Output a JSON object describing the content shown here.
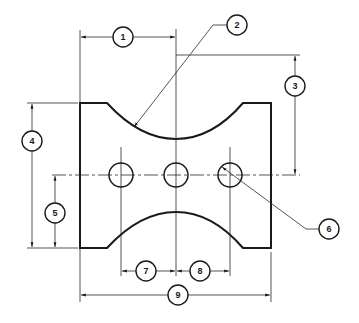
{
  "drawing": {
    "type": "engineering-dimension-drawing",
    "colors": {
      "line": "#1a1a1a",
      "background": "#ffffff"
    },
    "part": {
      "shape": "plate with concave top arc, convex bottom arc cutout, three holes",
      "holes_count": 3
    },
    "balloons": [
      {
        "id": "1",
        "label": "1",
        "meaning": "horizontal distance left edge to arc center"
      },
      {
        "id": "2",
        "label": "2",
        "meaning": "top arc radius leader"
      },
      {
        "id": "3",
        "label": "3",
        "meaning": "vertical distance arc center to hole centerline"
      },
      {
        "id": "4",
        "label": "4",
        "meaning": "overall height"
      },
      {
        "id": "5",
        "label": "5",
        "meaning": "bottom to hole centerline"
      },
      {
        "id": "6",
        "label": "6",
        "meaning": "hole diameter leader"
      },
      {
        "id": "7",
        "label": "7",
        "meaning": "left hole to center hole spacing"
      },
      {
        "id": "8",
        "label": "8",
        "meaning": "center hole to right hole spacing"
      },
      {
        "id": "9",
        "label": "9",
        "meaning": "overall width"
      }
    ]
  }
}
